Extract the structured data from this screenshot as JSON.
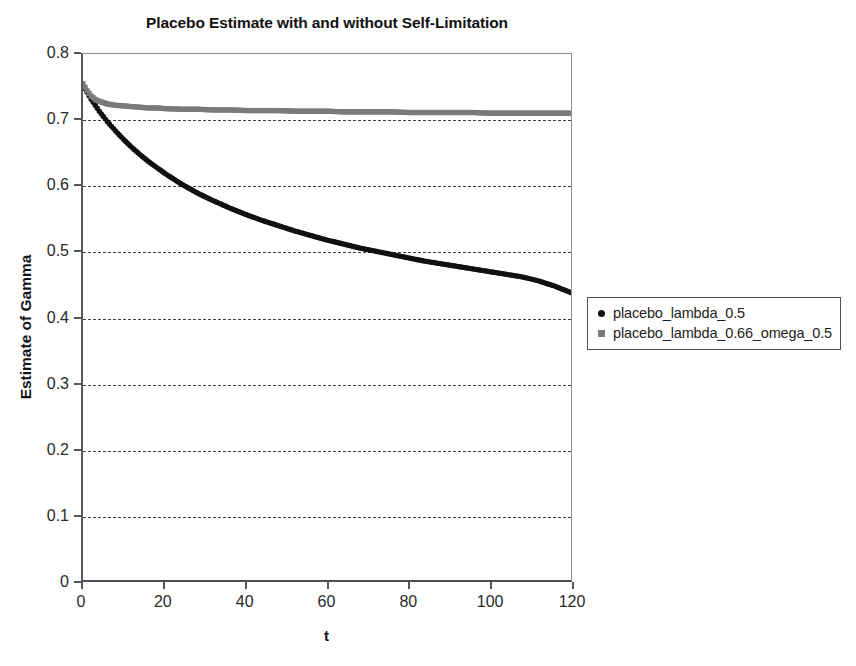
{
  "chart_data": {
    "type": "scatter",
    "title": "Placebo Estimate with and without Self-Limitation",
    "xlabel": "t",
    "ylabel": "Estimate of Gamma",
    "xlim": [
      0,
      120
    ],
    "ylim": [
      0,
      0.8
    ],
    "grid": true,
    "grid_axis": "y",
    "legend_position": "right",
    "x_ticks": [
      0,
      20,
      40,
      60,
      80,
      100,
      120
    ],
    "x_tick_labels": [
      "0",
      "20",
      "40",
      "60",
      "80",
      "100",
      "120"
    ],
    "y_ticks": [
      0,
      0.1,
      0.2,
      0.3,
      0.4,
      0.5,
      0.6,
      0.7,
      0.8
    ],
    "y_tick_labels": [
      "0",
      "0.1",
      "0.2",
      "0.3",
      "0.4",
      "0.5",
      "0.6",
      "0.7",
      "0.8"
    ],
    "series": [
      {
        "name": "placebo_lambda_0.5",
        "color": "#111111",
        "marker": "circle",
        "x": [
          0,
          1,
          2,
          3,
          4,
          5,
          6,
          8,
          10,
          12,
          14,
          16,
          18,
          20,
          24,
          28,
          32,
          36,
          40,
          44,
          48,
          52,
          56,
          60,
          64,
          68,
          72,
          76,
          80,
          84,
          88,
          92,
          96,
          100,
          104,
          108,
          112,
          116,
          120
        ],
        "y": [
          0.752,
          0.742,
          0.731,
          0.722,
          0.713,
          0.705,
          0.697,
          0.683,
          0.67,
          0.658,
          0.647,
          0.637,
          0.628,
          0.619,
          0.603,
          0.589,
          0.577,
          0.566,
          0.556,
          0.547,
          0.539,
          0.531,
          0.524,
          0.517,
          0.511,
          0.505,
          0.5,
          0.495,
          0.49,
          0.485,
          0.481,
          0.477,
          0.473,
          0.469,
          0.465,
          0.461,
          0.455,
          0.447,
          0.437
        ]
      },
      {
        "name": "placebo_lambda_0.66_omega_0.5",
        "color": "#7a7a7a",
        "marker": "square",
        "x": [
          0,
          1,
          2,
          3,
          4,
          5,
          6,
          8,
          10,
          12,
          14,
          16,
          18,
          20,
          24,
          28,
          32,
          36,
          40,
          44,
          48,
          52,
          56,
          60,
          64,
          68,
          72,
          76,
          80,
          84,
          88,
          92,
          96,
          100,
          104,
          108,
          112,
          116,
          120
        ],
        "y": [
          0.755,
          0.744,
          0.736,
          0.731,
          0.728,
          0.726,
          0.724,
          0.722,
          0.721,
          0.72,
          0.719,
          0.718,
          0.718,
          0.717,
          0.716,
          0.716,
          0.715,
          0.715,
          0.714,
          0.714,
          0.714,
          0.713,
          0.713,
          0.713,
          0.712,
          0.712,
          0.712,
          0.712,
          0.711,
          0.711,
          0.711,
          0.711,
          0.711,
          0.71,
          0.71,
          0.71,
          0.71,
          0.71,
          0.71
        ]
      }
    ]
  },
  "legend": {
    "entries": [
      {
        "label": "placebo_lambda_0.5",
        "marker": "circle-marker",
        "color": "#111111"
      },
      {
        "label": "placebo_lambda_0.66_omega_0.5",
        "marker": "square-marker",
        "color": "#7a7a7a"
      }
    ]
  }
}
